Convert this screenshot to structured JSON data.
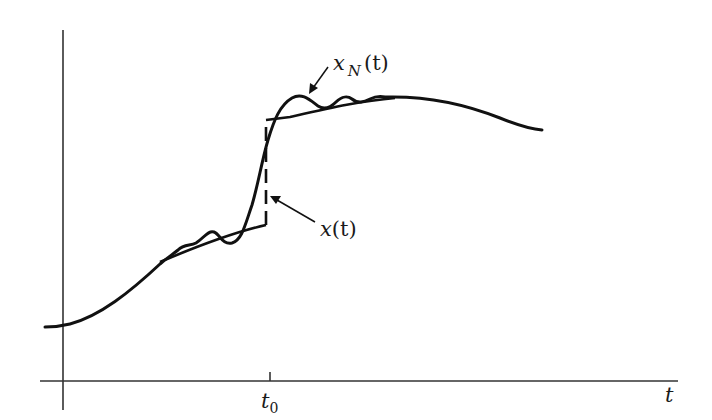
{
  "figure": {
    "axes": {
      "x_label": "t",
      "tick_label": "t",
      "tick_subscript": "0"
    },
    "labels": {
      "approx": {
        "main": "x",
        "subscript": "N",
        "arg": "(t)"
      },
      "original": {
        "main": "x",
        "arg": "(t)"
      }
    },
    "colors": {
      "stroke": "#111111",
      "axis": "#333333",
      "background": "#ffffff"
    }
  }
}
